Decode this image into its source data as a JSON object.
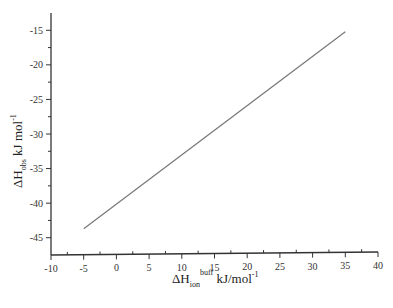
{
  "chart_data": {
    "type": "line",
    "title": "",
    "xlabel": "ΔH_ion^buff kJ/mol^-1",
    "ylabel": "ΔH_obs kJ mol^-1",
    "xlim": [
      -10,
      40
    ],
    "ylim": [
      -47.5,
      -12.5
    ],
    "x_ticks": [
      -10,
      -5,
      0,
      5,
      10,
      15,
      20,
      25,
      30,
      35,
      40
    ],
    "y_ticks": [
      -45,
      -40,
      -35,
      -30,
      -25,
      -20,
      -15
    ],
    "grid": false,
    "legend": null,
    "series": [
      {
        "name": "linear fit",
        "x": [
          -5,
          35
        ],
        "y": [
          -43.7,
          -15.2
        ],
        "color": "#777777"
      }
    ]
  },
  "labels": {
    "x_main": "ΔH",
    "x_sub": "ion",
    "x_sup": "buff",
    "x_unit": " kJ/mol",
    "x_unit_sup": "-1",
    "y_main": "ΔH",
    "y_sub": "obs",
    "y_unit": " kJ mol",
    "y_unit_sup": "-1"
  }
}
